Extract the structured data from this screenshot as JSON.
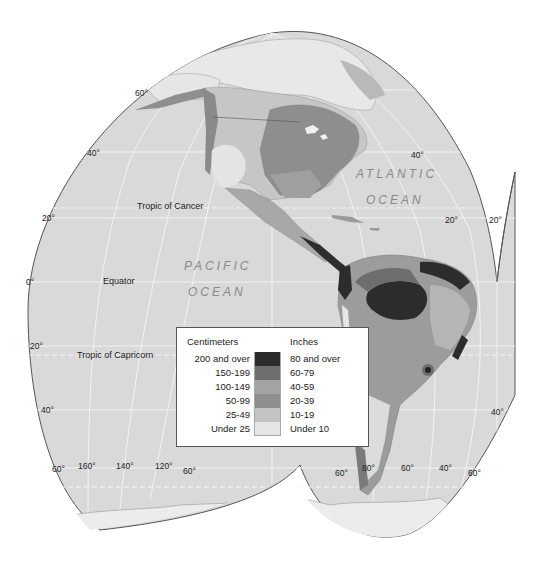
{
  "map": {
    "title": "Annual precipitation – Americas",
    "colors": {
      "ocean": "#d9d9d9",
      "graticule": "#f2f2f2",
      "outline": "#555555",
      "background": "#ffffff"
    }
  },
  "labels": {
    "tropic_cancer": "Tropic of Cancer",
    "equator": "Equator",
    "tropic_capricorn": "Tropic of Capricorn",
    "pacific": "PACIFIC",
    "pacific_ocean": "OCEAN",
    "atlantic": "ATLANTIC",
    "atlantic_ocean": "OCEAN"
  },
  "degrees": {
    "lat_60n": "60°",
    "lat_40n_left": "40°",
    "lat_20n_left": "20°",
    "lat_0_left": "0°",
    "lat_20s_left": "20°",
    "lat_40s_left": "40°",
    "lat_60s_left": "60°",
    "lon_160": "160°",
    "lon_140": "140°",
    "lon_120": "120°",
    "lon_60_left": "60°",
    "lat_40n_right": "40°",
    "lat_20n_right": "20°",
    "lat_20n_far": "20°",
    "lat_60s_sa_left": "60°",
    "lon_80": "80°",
    "lon_60": "60°",
    "lon_40": "40°",
    "lat_60s_right": "60°",
    "lat_40s_right": "40°"
  },
  "legend": {
    "cm_header": "Centimeters",
    "in_header": "Inches",
    "rows": [
      {
        "cm": "200 and over",
        "in": "80 and over",
        "color": "#2b2b2b"
      },
      {
        "cm": "150-199",
        "in": "60-79",
        "color": "#6e6e6e"
      },
      {
        "cm": "100-149",
        "in": "40-59",
        "color": "#a3a3a3"
      },
      {
        "cm": "50-99",
        "in": "20-39",
        "color": "#8e8e8e"
      },
      {
        "cm": "25-49",
        "in": "10-19",
        "color": "#c3c3c3"
      },
      {
        "cm": "Under 25",
        "in": "Under 10",
        "color": "#e6e6e6"
      }
    ]
  }
}
